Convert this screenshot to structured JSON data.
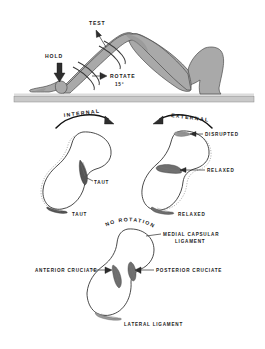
{
  "illustration": {
    "title": "Knee Rotation Ligament Test",
    "background_color": "#ffffff",
    "ink_color": "#1a1a1a",
    "limb_fill_color": "#a9a9a9",
    "ground_color": "#c9c9c9"
  },
  "panel_top": {
    "name": "leg-test-position",
    "labels": {
      "test": "TEST",
      "hold": "HOLD",
      "rotate": "ROTATE",
      "rotate_degrees": "15°"
    }
  },
  "panel_middle": {
    "name": "rotation-comparison",
    "left": {
      "heading": "INTERNAL",
      "callout_upper": "TAUT",
      "callout_lower": "TAUT"
    },
    "right": {
      "heading": "EXTERNAL",
      "callout_top": "DISRUPTED",
      "callout_middle": "RELAXED",
      "callout_lower": "RELAXED"
    }
  },
  "panel_bottom": {
    "name": "neutral-reference",
    "heading": "NO ROTATION",
    "labels": {
      "medial_capsular_line1": "MEDIAL CAPSULAR",
      "medial_capsular_line2": "LIGAMENT",
      "anterior_cruciate": "ANTERIOR CRUCIATE",
      "posterior_cruciate": "POSTERIOR CRUCIATE",
      "lateral_ligament": "LATERAL LIGAMENT"
    }
  }
}
